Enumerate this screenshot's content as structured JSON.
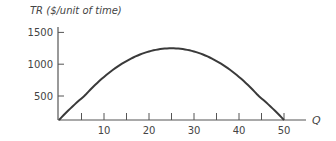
{
  "chart_data": {
    "type": "line",
    "title": "",
    "xlabel": "Q",
    "ylabel": "TR ($/unit of time)",
    "xlim": [
      0,
      52
    ],
    "ylim": [
      0,
      1500
    ],
    "x_ticks": [
      5,
      10,
      15,
      20,
      25,
      30,
      35,
      40,
      45,
      50
    ],
    "x_tick_labels": [
      {
        "value": 10,
        "label": "10"
      },
      {
        "value": 20,
        "label": "20"
      },
      {
        "value": 30,
        "label": "30"
      },
      {
        "value": 40,
        "label": "40"
      },
      {
        "value": 50,
        "label": "50"
      }
    ],
    "y_tick_labels": [
      {
        "value": 500,
        "label": "500"
      },
      {
        "value": 1000,
        "label": "1000"
      },
      {
        "value": 1500,
        "label": "1500"
      }
    ],
    "grid": false,
    "legend": null,
    "series": [
      {
        "name": "TR",
        "formula": "TR = 100Q - 2Q^2",
        "x": [
          0,
          5,
          10,
          15,
          20,
          25,
          30,
          35,
          40,
          45,
          50
        ],
        "values": [
          0,
          450,
          800,
          1050,
          1200,
          1250,
          1200,
          1050,
          800,
          450,
          0
        ]
      }
    ]
  },
  "colors": {
    "axis": "#555555",
    "curve": "#3a3a3a",
    "text": "#444444"
  }
}
